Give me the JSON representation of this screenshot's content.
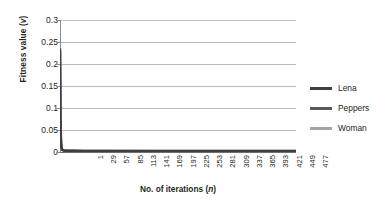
{
  "chart_data": {
    "type": "line",
    "title": "",
    "xlabel": "No. of iterations (n)",
    "xlabel_parts": {
      "main": "No. of iterations (",
      "italic": "n",
      "tail": ")"
    },
    "ylabel": "Fitness value (v)",
    "ylabel_parts": {
      "main": "Fitness value (",
      "italic": "v",
      "tail": ")"
    },
    "ylim": [
      0,
      0.3
    ],
    "xlim": [
      1,
      500
    ],
    "yticks": [
      "0.3",
      "0.25",
      "0.2",
      "0.15",
      "0.1",
      "0.05",
      "0"
    ],
    "ytick_values": [
      0.3,
      0.25,
      0.2,
      0.15,
      0.1,
      0.05,
      0
    ],
    "xticks": [
      "1",
      "29",
      "57",
      "85",
      "113",
      "141",
      "169",
      "197",
      "225",
      "253",
      "281",
      "309",
      "337",
      "365",
      "393",
      "421",
      "449",
      "477"
    ],
    "xtick_values": [
      1,
      29,
      57,
      85,
      113,
      141,
      169,
      197,
      225,
      253,
      281,
      309,
      337,
      365,
      393,
      421,
      449,
      477
    ],
    "grid": "horizontal",
    "legend_position": "right",
    "series": [
      {
        "name": "Lena",
        "color": "#3f3f3f",
        "x": [
          1,
          2,
          3,
          4,
          5,
          6,
          8,
          10,
          15,
          20,
          30,
          50,
          100,
          200,
          300,
          400,
          500
        ],
        "values": [
          0.235,
          0.082,
          0.028,
          0.012,
          0.007,
          0.005,
          0.004,
          0.0035,
          0.003,
          0.003,
          0.0028,
          0.0026,
          0.0025,
          0.0024,
          0.0024,
          0.0023,
          0.0023
        ]
      },
      {
        "name": "Peppers",
        "color": "#595959",
        "x": [
          1,
          2,
          3,
          4,
          5,
          6,
          8,
          10,
          15,
          20,
          30,
          50,
          100,
          200,
          300,
          400,
          500
        ],
        "values": [
          0.228,
          0.07,
          0.022,
          0.01,
          0.006,
          0.0045,
          0.0035,
          0.003,
          0.0026,
          0.0024,
          0.0022,
          0.0021,
          0.002,
          0.002,
          0.0019,
          0.0019,
          0.0019
        ]
      },
      {
        "name": "Woman",
        "color": "#a6a6a6",
        "x": [
          1,
          2,
          3,
          4,
          5,
          6,
          8,
          10,
          15,
          20,
          30,
          50,
          100,
          200,
          300,
          400,
          500
        ],
        "values": [
          0.236,
          0.09,
          0.032,
          0.014,
          0.008,
          0.006,
          0.0045,
          0.004,
          0.0035,
          0.0032,
          0.003,
          0.0028,
          0.0027,
          0.0026,
          0.0026,
          0.0025,
          0.0025
        ]
      }
    ]
  },
  "legend": {
    "items": [
      {
        "label": "Lena",
        "color": "#3f3f3f"
      },
      {
        "label": "Peppers",
        "color": "#595959"
      },
      {
        "label": "Woman",
        "color": "#a6a6a6"
      }
    ]
  },
  "colors": {
    "grid": "#b9b9b9",
    "axis": "#8d8d8d",
    "xaxis": "#6e6e6e",
    "text": "#231f20",
    "background": "#ffffff"
  }
}
